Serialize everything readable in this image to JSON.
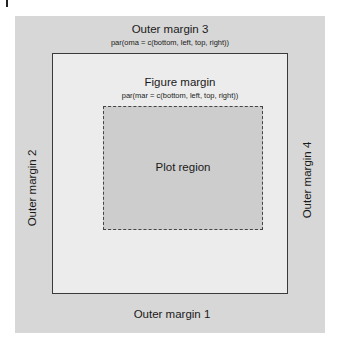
{
  "diagram": {
    "outer_margin_top": {
      "label": "Outer margin 3",
      "code": "par(oma = c(bottom, left, top, right))"
    },
    "outer_margin_bottom": {
      "label": "Outer margin 1"
    },
    "outer_margin_left": {
      "label": "Outer margin 2"
    },
    "outer_margin_right": {
      "label": "Outer margin 4"
    },
    "figure_margin": {
      "label": "Figure margin",
      "code": "par(mar = c(bottom, left, top, right))"
    },
    "plot_region": {
      "label": "Plot region"
    },
    "colors": {
      "outer_margin": "#d7d7d7",
      "figure_margin": "#ececec",
      "plot_region": "#cdcdcd",
      "border": "#3a3a3a"
    }
  }
}
